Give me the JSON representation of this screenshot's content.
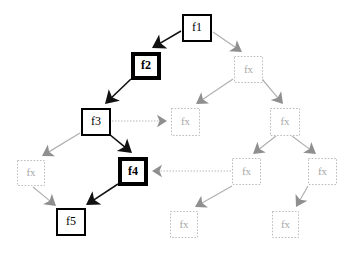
{
  "diagram": {
    "background_color": "#ffffff",
    "palette": {
      "active_node_stroke": "#000000",
      "active_edge": "#111111",
      "dim_node_stroke": "#bdbdbd",
      "dim_node_text": "#a8a8a8",
      "dim_edge": "#b0b0b0",
      "dotted_edge": "#b5b5b5"
    },
    "nodes": [
      {
        "id": "f1",
        "label": "f1",
        "x": 182,
        "y": 14,
        "w": 30,
        "h": 28,
        "style": "active-thin"
      },
      {
        "id": "f2",
        "label": "f2",
        "x": 131,
        "y": 52,
        "w": 30,
        "h": 28,
        "style": "active-thick"
      },
      {
        "id": "f3",
        "label": "f3",
        "x": 81,
        "y": 108,
        "w": 30,
        "h": 28,
        "style": "active-thin"
      },
      {
        "id": "f4",
        "label": "f4",
        "x": 118,
        "y": 157,
        "w": 30,
        "h": 29,
        "style": "active-thick"
      },
      {
        "id": "f5",
        "label": "f5",
        "x": 56,
        "y": 208,
        "w": 30,
        "h": 28,
        "style": "active-thin"
      },
      {
        "id": "fxA",
        "label": "fx",
        "x": 234,
        "y": 56,
        "w": 29,
        "h": 27,
        "style": "dim"
      },
      {
        "id": "fxB",
        "label": "fx",
        "x": 171,
        "y": 108,
        "w": 29,
        "h": 28,
        "style": "dim"
      },
      {
        "id": "fxC",
        "label": "fx",
        "x": 270,
        "y": 108,
        "w": 30,
        "h": 28,
        "style": "dim"
      },
      {
        "id": "fxD",
        "label": "fx",
        "x": 17,
        "y": 160,
        "w": 28,
        "h": 26,
        "style": "dim"
      },
      {
        "id": "fxE",
        "label": "fx",
        "x": 232,
        "y": 158,
        "w": 29,
        "h": 27,
        "style": "dim"
      },
      {
        "id": "fxF",
        "label": "fx",
        "x": 308,
        "y": 158,
        "w": 29,
        "h": 27,
        "style": "dim"
      },
      {
        "id": "fxG",
        "label": "fx",
        "x": 170,
        "y": 211,
        "w": 28,
        "h": 27,
        "style": "dim"
      },
      {
        "id": "fxH",
        "label": "fx",
        "x": 272,
        "y": 211,
        "w": 27,
        "h": 27,
        "style": "dim"
      }
    ],
    "edges": [
      {
        "from": "f1",
        "to": "f2",
        "style": "active",
        "x1": 181,
        "y1": 31,
        "x2": 152,
        "y2": 48
      },
      {
        "from": "f2",
        "to": "f3",
        "style": "active",
        "x1": 131,
        "y1": 79,
        "x2": 105,
        "y2": 104
      },
      {
        "from": "f3",
        "to": "f4",
        "style": "active",
        "x1": 109,
        "y1": 134,
        "x2": 132,
        "y2": 153
      },
      {
        "from": "f4",
        "to": "f5",
        "style": "active",
        "x1": 118,
        "y1": 184,
        "x2": 86,
        "y2": 205
      },
      {
        "from": "f1",
        "to": "fxA",
        "style": "dim",
        "x1": 213,
        "y1": 32,
        "x2": 242,
        "y2": 52
      },
      {
        "from": "fxA",
        "to": "fxB",
        "style": "dim",
        "x1": 233,
        "y1": 79,
        "x2": 196,
        "y2": 104
      },
      {
        "from": "fxA",
        "to": "fxC",
        "style": "dim",
        "x1": 262,
        "y1": 79,
        "x2": 283,
        "y2": 104
      },
      {
        "from": "fxC",
        "to": "fxE",
        "style": "dim",
        "x1": 276,
        "y1": 136,
        "x2": 253,
        "y2": 154
      },
      {
        "from": "fxC",
        "to": "fxF",
        "style": "dim",
        "x1": 292,
        "y1": 136,
        "x2": 316,
        "y2": 154
      },
      {
        "from": "fxE",
        "to": "fxG",
        "style": "dim",
        "x1": 232,
        "y1": 186,
        "x2": 195,
        "y2": 207
      },
      {
        "from": "fxF",
        "to": "fxH",
        "style": "dim",
        "x1": 308,
        "y1": 186,
        "x2": 296,
        "y2": 207
      },
      {
        "from": "f3",
        "to": "fxD",
        "style": "dim",
        "x1": 80,
        "y1": 133,
        "x2": 42,
        "y2": 156
      },
      {
        "from": "fxD",
        "to": "f5",
        "style": "dim",
        "x1": 33,
        "y1": 187,
        "x2": 56,
        "y2": 206
      },
      {
        "from": "f3",
        "to": "fxB",
        "style": "dotted",
        "x1": 112,
        "y1": 121,
        "x2": 167,
        "y2": 121
      },
      {
        "from": "fxE",
        "to": "f4",
        "style": "dotted",
        "x1": 231,
        "y1": 171,
        "x2": 152,
        "y2": 171
      }
    ]
  }
}
